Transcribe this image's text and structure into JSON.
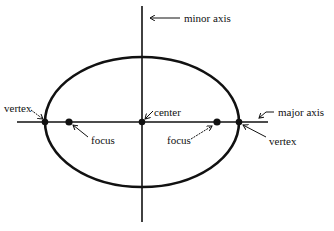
{
  "diagram": {
    "colors": {
      "stroke": "#111111",
      "background": "#ffffff"
    },
    "labels": {
      "minor_axis": "minor axis",
      "major_axis": "major axis",
      "center": "center",
      "vertex_left": "vertex",
      "vertex_right": "vertex",
      "focus_left": "focus",
      "focus_right": "focus"
    },
    "geometry": {
      "center": [
        142,
        122
      ],
      "rx": 97,
      "ry": 65,
      "foci_x": [
        69,
        217
      ],
      "vertices_x": [
        45,
        239
      ]
    }
  }
}
